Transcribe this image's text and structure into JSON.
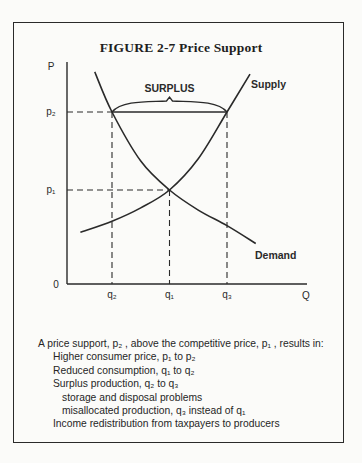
{
  "figure": {
    "title": "FIGURE 2-7  Price Support"
  },
  "chart_data": {
    "type": "line",
    "title": "FIGURE 2-7  Price Support",
    "xlabel": "Q",
    "ylabel": "P",
    "origin_label": "0",
    "x_ticks": [
      "q₂",
      "q₁",
      "q₃"
    ],
    "y_ticks": [
      "p₂",
      "p₁"
    ],
    "x_values": {
      "q2": 2,
      "q1": 4,
      "q3": 6
    },
    "y_values": {
      "p1": 4,
      "p2": 7.5
    },
    "xlim": [
      0,
      9
    ],
    "ylim": [
      0,
      10
    ],
    "series": [
      {
        "name": "Supply",
        "points": [
          [
            0.9,
            2.1
          ],
          [
            2,
            2.6
          ],
          [
            3,
            3.2
          ],
          [
            4,
            4
          ],
          [
            5,
            5.4
          ],
          [
            6,
            7.5
          ],
          [
            6.8,
            9.2
          ]
        ]
      },
      {
        "name": "Demand",
        "points": [
          [
            1.4,
            9.3
          ],
          [
            2,
            7.5
          ],
          [
            3,
            5.3
          ],
          [
            4,
            4
          ],
          [
            5,
            3.1
          ],
          [
            6,
            2.4
          ],
          [
            7,
            1.6
          ]
        ]
      }
    ],
    "annotations": [
      {
        "text": "SURPLUS",
        "from_x": "q2",
        "to_x": "q3",
        "at_y": "p2",
        "style": "brace"
      }
    ],
    "guides": "dashed lines from p1, p2 to curves and from q2, q1, q3 down to axis",
    "grid": false
  },
  "notes": {
    "intro": "A price support, p₂ , above the competitive price, p₁ , results in:",
    "items": [
      "Higher consumer price, p₁  to p₂",
      "Reduced consumption, q₁  to q₂",
      "Surplus production, q₂  to q₃"
    ],
    "subitems": [
      "storage and disposal problems",
      "misallocated production, q₃  instead of q₁"
    ],
    "last": "Income redistribution from taxpayers to producers"
  }
}
